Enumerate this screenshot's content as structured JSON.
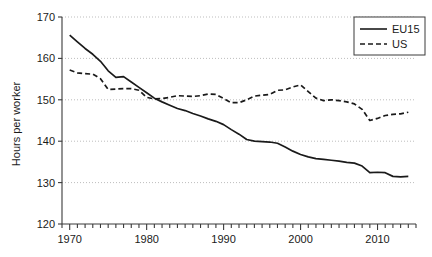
{
  "chart_data": {
    "type": "line",
    "title": "",
    "subtitle": "",
    "xlabel": "",
    "ylabel": "Hours per worker",
    "xlim": [
      1969,
      2015
    ],
    "ylim": [
      120,
      170
    ],
    "ytick_labels": [
      "120",
      "130",
      "140",
      "150",
      "160",
      "170"
    ],
    "ytick_values": [
      120,
      130,
      140,
      150,
      160,
      170
    ],
    "xtick_labels": [
      "1970",
      "1980",
      "1990",
      "2000",
      "2010"
    ],
    "xtick_values": [
      1970,
      1980,
      1990,
      2000,
      2010
    ],
    "minor_xtick_step": 1,
    "grid": "horizontal-dotted",
    "legend_position": "top-right",
    "legend_entries": [
      {
        "name": "EU15",
        "style": "solid"
      },
      {
        "name": "US",
        "style": "dashed"
      }
    ],
    "x": [
      1970,
      1971,
      1972,
      1973,
      1974,
      1975,
      1976,
      1977,
      1978,
      1979,
      1980,
      1981,
      1982,
      1983,
      1984,
      1985,
      1986,
      1987,
      1988,
      1989,
      1990,
      1991,
      1992,
      1993,
      1994,
      1995,
      1996,
      1997,
      1998,
      1999,
      2000,
      2001,
      2002,
      2003,
      2004,
      2005,
      2006,
      2007,
      2008,
      2009,
      2010,
      2011,
      2012,
      2013,
      2014
    ],
    "series": [
      {
        "name": "EU15",
        "style": "solid",
        "color": "#1a1a1a",
        "values": [
          165.6,
          164.0,
          162.4,
          161.0,
          159.3,
          157.0,
          155.4,
          155.6,
          154.3,
          153.0,
          151.7,
          150.4,
          149.5,
          148.7,
          147.9,
          147.4,
          146.7,
          146.1,
          145.4,
          144.8,
          144.0,
          142.8,
          141.7,
          140.4,
          140.0,
          139.9,
          139.8,
          139.5,
          138.6,
          137.6,
          136.8,
          136.2,
          135.8,
          135.6,
          135.4,
          135.2,
          134.9,
          134.7,
          134.0,
          132.4,
          132.5,
          132.4,
          131.5,
          131.4,
          131.5
        ]
      },
      {
        "name": "US",
        "style": "dashed",
        "color": "#1a1a1a",
        "values": [
          157.2,
          156.5,
          156.3,
          156.2,
          155.1,
          152.5,
          152.6,
          152.7,
          152.7,
          152.3,
          150.6,
          150.2,
          150.3,
          150.6,
          151.0,
          150.9,
          150.8,
          151.0,
          151.4,
          151.3,
          150.3,
          149.3,
          149.3,
          150.0,
          150.9,
          151.1,
          151.3,
          152.3,
          152.4,
          153.1,
          153.6,
          152.0,
          150.4,
          149.8,
          150.0,
          149.8,
          149.5,
          149.0,
          147.7,
          145.0,
          145.5,
          146.2,
          146.5,
          146.6,
          147.0
        ]
      }
    ]
  }
}
